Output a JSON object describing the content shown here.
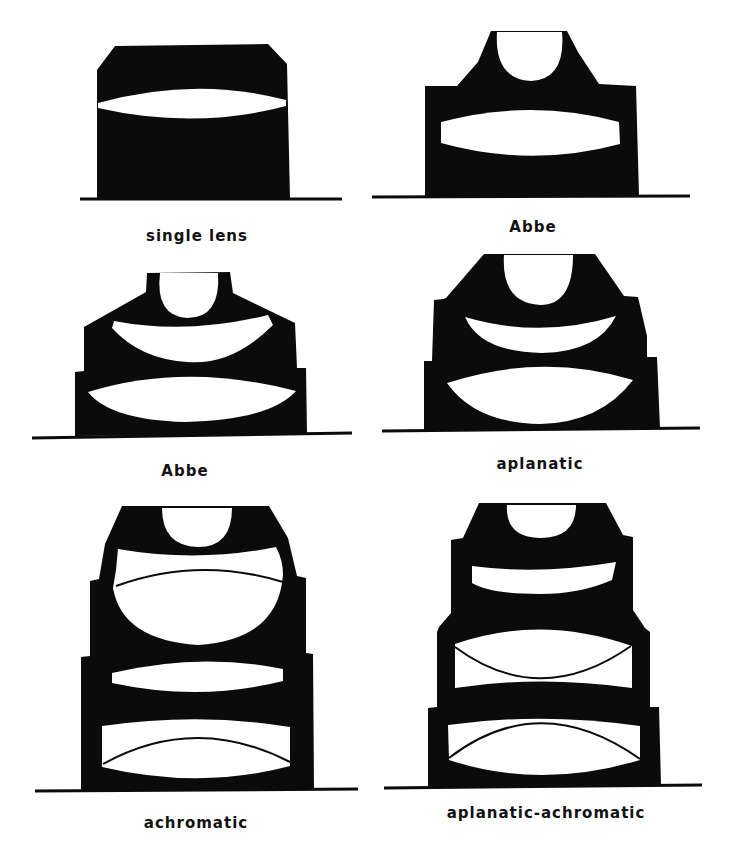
{
  "figure": {
    "colors": {
      "ink": "#0b0b0b",
      "glass": "#ffffff",
      "background": "#ffffff"
    }
  },
  "panels": [
    {
      "id": "single-lens",
      "label": "single lens",
      "lens_elements": 1
    },
    {
      "id": "abbe-2-lens",
      "label": "Abbe",
      "lens_elements": 2
    },
    {
      "id": "abbe-3-lens",
      "label": "Abbe",
      "lens_elements": 3
    },
    {
      "id": "aplanatic",
      "label": "aplanatic",
      "lens_elements": 3
    },
    {
      "id": "achromatic",
      "label": "achromatic",
      "lens_elements": 4,
      "cemented_doublets": 2
    },
    {
      "id": "aplanatic-achromatic",
      "label": "aplanatic-achromatic",
      "lens_elements": 5,
      "cemented_doublets": 2
    }
  ]
}
